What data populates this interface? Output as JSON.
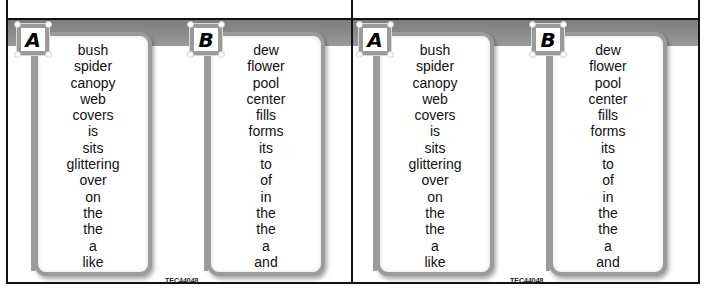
{
  "panels": [
    {
      "card_a": {
        "label": "A",
        "words": [
          "bush",
          "spider",
          "canopy",
          "web",
          "covers",
          "is",
          "sits",
          "glittering",
          "over",
          "on",
          "the",
          "the",
          "a",
          "like"
        ]
      },
      "card_b": {
        "label": "B",
        "words": [
          "dew",
          "flower",
          "pool",
          "center",
          "fills",
          "forms",
          "its",
          "to",
          "of",
          "in",
          "the",
          "the",
          "a",
          "and"
        ]
      },
      "code": "TEC44048"
    },
    {
      "card_a": {
        "label": "A",
        "words": [
          "bush",
          "spider",
          "canopy",
          "web",
          "covers",
          "is",
          "sits",
          "glittering",
          "over",
          "on",
          "the",
          "the",
          "a",
          "like"
        ]
      },
      "card_b": {
        "label": "B",
        "words": [
          "dew",
          "flower",
          "pool",
          "center",
          "fills",
          "forms",
          "its",
          "to",
          "of",
          "in",
          "the",
          "the",
          "a",
          "and"
        ]
      },
      "code": "TEC44048"
    }
  ],
  "colors": {
    "band": "#8a8a8a",
    "card_border": "#9b9b9b",
    "frame": "#111111"
  }
}
